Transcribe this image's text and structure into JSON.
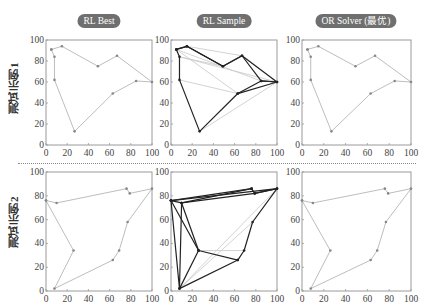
{
  "columns": [
    {
      "label": "RL Best",
      "center_x": 99
    },
    {
      "label": "RL Sample",
      "center_x": 224
    },
    {
      "label": "OR Solver (最优)",
      "center_x": 356
    }
  ],
  "rows": [
    {
      "label": "测试示例1"
    },
    {
      "label": "测试示例2"
    }
  ],
  "colors": {
    "pill_bg": "#6f6f6f",
    "route_light": "#b5b5b5",
    "route_dark": "#222222",
    "frame": "#9a9a9a"
  },
  "chart_data": [
    {
      "type": "scatter",
      "title": "RL Best — 测试示例1",
      "xlim": [
        0,
        100
      ],
      "ylim": [
        0,
        100
      ],
      "xticks": [
        0,
        20,
        40,
        60,
        80,
        100
      ],
      "yticks": [
        0,
        20,
        40,
        60,
        80,
        100
      ],
      "route": [
        [
          5,
          91
        ],
        [
          8,
          84
        ],
        [
          8,
          62
        ],
        [
          27,
          13
        ],
        [
          63,
          49
        ],
        [
          85,
          61
        ],
        [
          100,
          60
        ],
        [
          67,
          85
        ],
        [
          49,
          75
        ],
        [
          15,
          94
        ],
        [
          5,
          91
        ]
      ]
    },
    {
      "type": "scatter",
      "title": "RL Sample — 测试示例1",
      "xlim": [
        0,
        100
      ],
      "ylim": [
        0,
        100
      ],
      "xticks": [
        0,
        20,
        40,
        60,
        80,
        100
      ],
      "yticks": [
        0,
        20,
        40,
        60,
        80,
        100
      ],
      "routes_dark": [
        [
          [
            5,
            91
          ],
          [
            8,
            84
          ],
          [
            8,
            62
          ],
          [
            27,
            13
          ],
          [
            63,
            49
          ],
          [
            85,
            61
          ],
          [
            100,
            60
          ],
          [
            67,
            85
          ],
          [
            49,
            75
          ],
          [
            15,
            94
          ],
          [
            5,
            91
          ]
        ],
        [
          [
            5,
            91
          ],
          [
            15,
            94
          ],
          [
            49,
            75
          ],
          [
            67,
            85
          ],
          [
            85,
            61
          ],
          [
            100,
            60
          ],
          [
            63,
            49
          ]
        ]
      ],
      "routes_light": [
        [
          [
            5,
            91
          ],
          [
            85,
            61
          ]
        ],
        [
          [
            8,
            84
          ],
          [
            49,
            75
          ]
        ],
        [
          [
            15,
            94
          ],
          [
            67,
            85
          ]
        ],
        [
          [
            8,
            62
          ],
          [
            63,
            49
          ]
        ],
        [
          [
            8,
            84
          ],
          [
            100,
            60
          ]
        ],
        [
          [
            27,
            13
          ],
          [
            100,
            60
          ]
        ],
        [
          [
            5,
            91
          ],
          [
            63,
            49
          ]
        ]
      ]
    },
    {
      "type": "scatter",
      "title": "OR Solver (最优) — 测试示例1",
      "xlim": [
        0,
        100
      ],
      "ylim": [
        0,
        100
      ],
      "xticks": [
        0,
        20,
        40,
        60,
        80,
        100
      ],
      "yticks": [
        0,
        20,
        40,
        60,
        80,
        100
      ],
      "route": [
        [
          5,
          91
        ],
        [
          8,
          84
        ],
        [
          8,
          62
        ],
        [
          27,
          13
        ],
        [
          63,
          49
        ],
        [
          85,
          61
        ],
        [
          100,
          60
        ],
        [
          67,
          85
        ],
        [
          49,
          75
        ],
        [
          15,
          94
        ],
        [
          5,
          91
        ]
      ]
    },
    {
      "type": "scatter",
      "title": "RL Best — 测试示例2",
      "xlim": [
        0,
        100
      ],
      "ylim": [
        0,
        100
      ],
      "xticks": [
        0,
        20,
        40,
        60,
        80,
        100
      ],
      "yticks": [
        0,
        20,
        40,
        60,
        80,
        100
      ],
      "route": [
        [
          0,
          76
        ],
        [
          10,
          74
        ],
        [
          76,
          86
        ],
        [
          79,
          82
        ],
        [
          100,
          86
        ],
        [
          77,
          58
        ],
        [
          69,
          34
        ],
        [
          63,
          26
        ],
        [
          8,
          2
        ],
        [
          26,
          34
        ],
        [
          0,
          76
        ]
      ]
    },
    {
      "type": "scatter",
      "title": "RL Sample — 测试示例2",
      "xlim": [
        0,
        100
      ],
      "ylim": [
        0,
        100
      ],
      "xticks": [
        0,
        20,
        40,
        60,
        80,
        100
      ],
      "yticks": [
        0,
        20,
        40,
        60,
        80,
        100
      ],
      "routes_dark": [
        [
          [
            0,
            76
          ],
          [
            10,
            74
          ],
          [
            76,
            86
          ],
          [
            79,
            82
          ],
          [
            100,
            86
          ],
          [
            77,
            58
          ],
          [
            69,
            34
          ],
          [
            63,
            26
          ],
          [
            8,
            2
          ],
          [
            26,
            34
          ],
          [
            0,
            76
          ]
        ],
        [
          [
            0,
            76
          ],
          [
            100,
            86
          ],
          [
            79,
            82
          ],
          [
            10,
            74
          ],
          [
            8,
            2
          ],
          [
            0,
            76
          ]
        ],
        [
          [
            26,
            34
          ],
          [
            63,
            26
          ]
        ],
        [
          [
            10,
            74
          ],
          [
            26,
            34
          ]
        ],
        [
          [
            0,
            76
          ],
          [
            76,
            86
          ]
        ]
      ],
      "routes_light": [
        [
          [
            8,
            2
          ],
          [
            77,
            58
          ]
        ],
        [
          [
            26,
            34
          ],
          [
            69,
            34
          ]
        ],
        [
          [
            8,
            2
          ],
          [
            100,
            86
          ]
        ]
      ]
    },
    {
      "type": "scatter",
      "title": "OR Solver (最优) — 测试示例2",
      "xlim": [
        0,
        100
      ],
      "ylim": [
        0,
        100
      ],
      "xticks": [
        0,
        20,
        40,
        60,
        80,
        100
      ],
      "yticks": [
        0,
        20,
        40,
        60,
        80,
        100
      ],
      "route": [
        [
          0,
          76
        ],
        [
          10,
          74
        ],
        [
          76,
          86
        ],
        [
          79,
          82
        ],
        [
          100,
          86
        ],
        [
          77,
          58
        ],
        [
          69,
          34
        ],
        [
          63,
          26
        ],
        [
          8,
          2
        ],
        [
          26,
          34
        ],
        [
          0,
          76
        ]
      ]
    }
  ]
}
